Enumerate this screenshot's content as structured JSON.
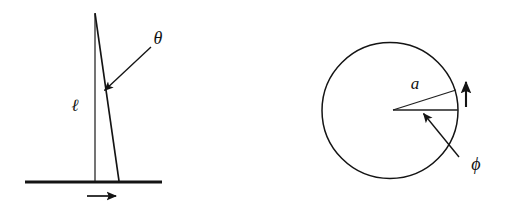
{
  "figure": {
    "canvas": {
      "width": 506,
      "height": 209,
      "background": "#ffffff"
    },
    "ink_color": "#141414",
    "panels": [
      {
        "id": "pendulum",
        "name": "inverted-pendulum-diagram",
        "labels": {
          "length": "ℓ",
          "angle": "θ"
        },
        "geometry": {
          "ground_line": {
            "x1": 25,
            "y1": 182,
            "x2": 162,
            "y2": 182,
            "stroke_width": 3.2
          },
          "vertical_reference": {
            "x1": 95,
            "y1": 14,
            "x2": 95,
            "y2": 181,
            "stroke_width": 1.3
          },
          "pendulum_rod": {
            "x1": 95,
            "y1": 13,
            "x2": 119,
            "y2": 181,
            "stroke_width": 1.6
          },
          "angle_pointer": {
            "x1": 151,
            "y1": 47,
            "x2": 103,
            "y2": 92,
            "stroke_width": 1.4,
            "arrow": "end"
          },
          "motion_arrow": {
            "x1": 87,
            "y1": 196,
            "x2": 118,
            "y2": 196,
            "stroke_width": 1.6,
            "arrow": "end"
          },
          "length_label_pos": {
            "x": 75,
            "y": 110
          },
          "angle_label_pos": {
            "x": 151,
            "y": 43
          }
        }
      },
      {
        "id": "disk",
        "name": "rotating-disk-diagram",
        "labels": {
          "radius": "a",
          "angle": "ϕ"
        },
        "geometry": {
          "circle": {
            "cx": 390,
            "cy": 110.5,
            "r": 68,
            "stroke_width": 1.5
          },
          "horizontal_radius": {
            "x1": 393,
            "y1": 110,
            "x2": 458,
            "y2": 110,
            "stroke_width": 1.3
          },
          "slanted_radius": {
            "x1": 393,
            "y1": 110,
            "x2": 456,
            "y2": 90,
            "stroke_width": 1.3
          },
          "angle_pointer": {
            "x1": 459,
            "y1": 157,
            "x2": 422,
            "y2": 112,
            "stroke_width": 1.4,
            "arrow": "end"
          },
          "rotation_arrow": {
            "x1": 466,
            "y1": 107,
            "x2": 466,
            "y2": 79,
            "stroke_width": 2.0,
            "arrow": "end"
          },
          "radius_label_pos": {
            "x": 409,
            "y": 88
          },
          "angle_label_pos": {
            "x": 469,
            "y": 170
          }
        }
      }
    ]
  }
}
